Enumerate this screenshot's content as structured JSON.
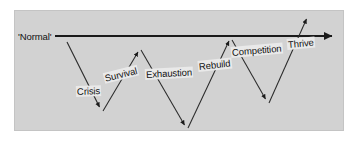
{
  "diagram": {
    "type": "zigzag-phase-diagram",
    "background_color": "#ffffff",
    "panel_color": "#d2d2d2",
    "panel_border_color": "#c4c4c4",
    "line_color": "#1a1a1a",
    "label_background_color": "#e9e9e9",
    "label_text_color": "#111111",
    "baseline": {
      "label": "'Normal'",
      "label_x": 18,
      "label_y": 31,
      "start_x": 55,
      "start_y": 36,
      "end_x": 337,
      "end_y": 36
    },
    "nodes": [
      {
        "id": "crisis",
        "label": "Crisis",
        "label_x": 76,
        "label_y": 86,
        "rotation": -2,
        "segment": {
          "x1": 67,
          "y1": 42,
          "x2": 101,
          "y2": 110
        },
        "direction": "down"
      },
      {
        "id": "survival",
        "label": "Survival",
        "label_x": 104,
        "label_y": 73,
        "rotation": -14,
        "segment": {
          "x1": 103,
          "y1": 111,
          "x2": 139,
          "y2": 49
        },
        "direction": "up"
      },
      {
        "id": "exhaustion",
        "label": "Exhaustion",
        "label_x": 145,
        "label_y": 69,
        "rotation": -3,
        "segment": {
          "x1": 141,
          "y1": 50,
          "x2": 186,
          "y2": 128
        },
        "direction": "down"
      },
      {
        "id": "rebuild",
        "label": "Rebuild",
        "label_x": 198,
        "label_y": 61,
        "rotation": -6,
        "segment": {
          "x1": 188,
          "y1": 128,
          "x2": 230,
          "y2": 38
        },
        "direction": "up"
      },
      {
        "id": "competition",
        "label": "Competition",
        "label_x": 231,
        "label_y": 47,
        "rotation": -5,
        "segment": {
          "x1": 232,
          "y1": 40,
          "x2": 267,
          "y2": 102
        },
        "direction": "down"
      },
      {
        "id": "thrive",
        "label": "Thrive",
        "label_x": 287,
        "label_y": 39,
        "rotation": -5,
        "segment": {
          "x1": 269,
          "y1": 103,
          "x2": 308,
          "y2": 16
        },
        "direction": "up"
      }
    ]
  }
}
